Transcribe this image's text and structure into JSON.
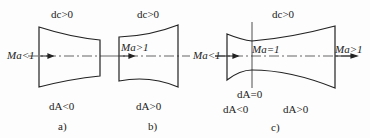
{
  "diagrams": [
    {
      "id": "a",
      "caption": "a)",
      "top_label": "dc>0",
      "bottom_label": "dA<0",
      "inlet_label": "Ma<1",
      "shape": "converging"
    },
    {
      "id": "b",
      "caption": "b)",
      "top_label": "dc>0",
      "bottom_label": "dA>0",
      "inlet_label": "Ma>1",
      "shape": "diverging"
    },
    {
      "id": "c",
      "caption": "c)",
      "top_label": "dc>0",
      "inlet_label": "Ma<1",
      "throat_label": "Ma=1",
      "outlet_label": "Ma>1",
      "throat_area_label": "dA=0",
      "converging_label": "dA<0",
      "diverging_label": "dA>0",
      "shape": "converging-diverging (Laval nozzle)"
    }
  ],
  "colors": {
    "stroke": "#222222",
    "background": "#fdfdfd"
  }
}
